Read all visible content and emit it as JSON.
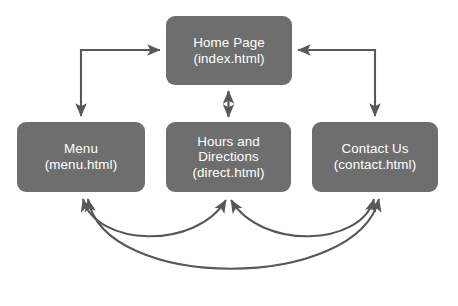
{
  "diagram": {
    "type": "site-map-flowchart",
    "background_color": "#ffffff",
    "node_fill_color": "#6e6e6e",
    "node_text_color": "#ffffff",
    "connector_color": "#58585a",
    "nodes": [
      {
        "id": "home",
        "title": "Home Page",
        "file": "(index.html)"
      },
      {
        "id": "menu",
        "title": "Menu",
        "file": "(menu.html)"
      },
      {
        "id": "hours",
        "title_line1": "Hours and",
        "title_line2": "Directions",
        "file": "(direct.html)"
      },
      {
        "id": "contact",
        "title": "Contact Us",
        "file": "(contact.html)"
      }
    ],
    "connectors": [
      {
        "id": "home-menu",
        "from": "home",
        "to": "menu",
        "style": "elbow",
        "direction": "bidirectional"
      },
      {
        "id": "home-contact",
        "from": "home",
        "to": "contact",
        "style": "elbow",
        "direction": "bidirectional"
      },
      {
        "id": "home-hours",
        "from": "home",
        "to": "hours",
        "style": "straight-vertical",
        "direction": "bidirectional"
      },
      {
        "id": "menu-hours",
        "from": "menu",
        "to": "hours",
        "style": "curve-shallow",
        "direction": "bidirectional"
      },
      {
        "id": "hours-contact",
        "from": "hours",
        "to": "contact",
        "style": "curve-shallow",
        "direction": "bidirectional"
      },
      {
        "id": "menu-contact",
        "from": "menu",
        "to": "contact",
        "style": "curve-deep",
        "direction": "bidirectional"
      }
    ]
  }
}
